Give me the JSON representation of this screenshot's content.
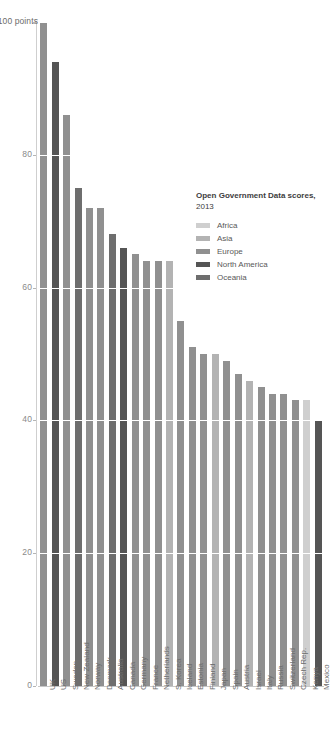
{
  "chart_data": {
    "type": "bar",
    "title": "Open Government Data scores, 2013",
    "xlabel": "",
    "ylabel": "scale",
    "ylim": [
      0,
      100
    ],
    "yticks": [
      0,
      20,
      40,
      60,
      80,
      100
    ],
    "ytick_labels": [
      "0",
      "20",
      "40",
      "60",
      "80",
      "100 points"
    ],
    "grid": true,
    "legend_position": "right",
    "categories": [
      "UK",
      "US",
      "Sweden",
      "New Zealand",
      "Norway",
      "Denmark",
      "Australia",
      "Canada",
      "Germany",
      "France",
      "Netherlands",
      "S. Korea",
      "Iceland",
      "Estonia",
      "Finland",
      "Japan",
      "Spain",
      "Austria",
      "Israel",
      "Italy",
      "Russia",
      "Switzerland",
      "Czech Rep.",
      "Kenya",
      "Mexico"
    ],
    "values": [
      100,
      94,
      86,
      75,
      72,
      72,
      68,
      66,
      65,
      64,
      64,
      64,
      55,
      51,
      50,
      50,
      49,
      47,
      46,
      45,
      44,
      44,
      43,
      43,
      40
    ],
    "groups": [
      "Europe",
      "North America",
      "Europe",
      "Oceania",
      "Europe",
      "Europe",
      "Oceania",
      "North America",
      "Europe",
      "Europe",
      "Europe",
      "Asia",
      "Europe",
      "Europe",
      "Europe",
      "Asia",
      "Europe",
      "Europe",
      "Asia",
      "Europe",
      "Europe",
      "Europe",
      "Europe",
      "Africa",
      "North America"
    ],
    "legend": [
      {
        "label": "Africa",
        "color": "#cfcfcf"
      },
      {
        "label": "Asia",
        "color": "#b3b3b3"
      },
      {
        "label": "Europe",
        "color": "#909090"
      },
      {
        "label": "North America",
        "color": "#555555"
      },
      {
        "label": "Oceania",
        "color": "#6e6e6e"
      }
    ],
    "legend_title_bold": "Open Government Data scores,",
    "legend_title_year": " 2013"
  }
}
